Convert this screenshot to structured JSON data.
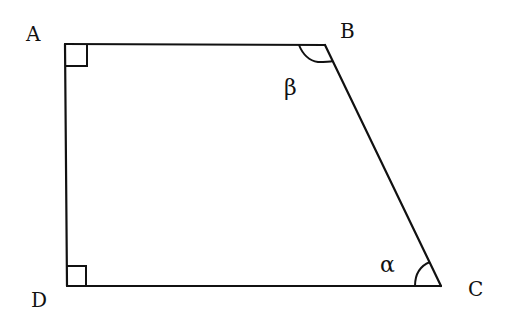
{
  "diagram": {
    "type": "quadrilateral",
    "shape": "right trapezoid",
    "vertices": [
      {
        "name": "A",
        "x": 65,
        "y": 44
      },
      {
        "name": "B",
        "x": 325,
        "y": 45
      },
      {
        "name": "C",
        "x": 441,
        "y": 286
      },
      {
        "name": "D",
        "x": 67,
        "y": 286
      }
    ],
    "labels": {
      "A": "A",
      "B": "B",
      "C": "C",
      "D": "D"
    },
    "angles": {
      "at_B": {
        "symbol": "β",
        "type": "arc"
      },
      "at_C": {
        "symbol": "α",
        "type": "arc"
      },
      "at_A": {
        "type": "right-angle"
      },
      "at_D": {
        "type": "right-angle"
      }
    },
    "colors": {
      "stroke": "#111111",
      "background": "#ffffff"
    }
  }
}
